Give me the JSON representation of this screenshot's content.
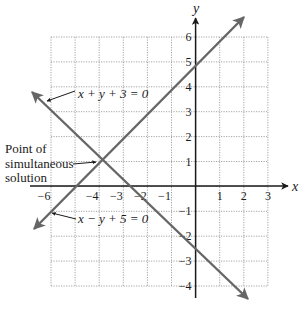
{
  "figure": {
    "title": "",
    "axes": {
      "x_label": "x",
      "y_label": "y",
      "x_ticks": [
        "−6",
        "−4",
        "−3",
        "−2",
        "−1",
        "1",
        "2",
        "3"
      ],
      "x_tick_values": [
        -6,
        -4,
        -3,
        -2,
        -1,
        1,
        2,
        3
      ],
      "y_ticks": [
        "6",
        "5",
        "4",
        "3",
        "2",
        "1",
        "−1",
        "−2",
        "−3",
        "−4"
      ],
      "y_tick_values": [
        6,
        5,
        4,
        3,
        2,
        1,
        -1,
        -2,
        -3,
        -4
      ],
      "grid": {
        "x_min": -6,
        "x_max": 3,
        "y_min": -4,
        "y_max": 6,
        "style": "dotted"
      }
    },
    "lines": [
      {
        "name": "line-x-plus-y-plus-3",
        "equation": "x + y + 3 = 0",
        "slope": -1,
        "y_intercept": -3,
        "color": "#666666"
      },
      {
        "name": "line-x-minus-y-plus-5",
        "equation": "x − y + 5 = 0",
        "slope": 1,
        "y_intercept": 5,
        "color": "#666666"
      }
    ],
    "intersection": {
      "x": -4,
      "y": 1
    },
    "annotations": {
      "point_label_line1": "Point of",
      "point_label_line2": "simultaneous",
      "point_label_line3": "solution"
    },
    "colors": {
      "axis": "#1a1a1a",
      "grid": "#9a9a9a",
      "line": "#666666",
      "text": "#1a1a1a"
    }
  },
  "chart_data": {
    "type": "line",
    "title": "",
    "xlabel": "x",
    "ylabel": "y",
    "xlim": [
      -6,
      3
    ],
    "ylim": [
      -4,
      6
    ],
    "grid": true,
    "series": [
      {
        "name": "x + y + 3 = 0",
        "x": [
          -6,
          -4,
          -3,
          0,
          1
        ],
        "values": [
          3,
          1,
          0,
          -3,
          -4
        ]
      },
      {
        "name": "x − y + 5 = 0",
        "x": [
          -6,
          -5,
          -4,
          0,
          1
        ],
        "values": [
          -1,
          0,
          1,
          5,
          6
        ]
      }
    ],
    "annotations": [
      {
        "text": "x + y + 3 = 0",
        "points_to": "line 1 (upper left)"
      },
      {
        "text": "x − y + 5 = 0",
        "points_to": "line 2 (lower left)"
      },
      {
        "text": "Point of simultaneous solution",
        "points_to": [
          -4,
          1
        ]
      }
    ]
  }
}
